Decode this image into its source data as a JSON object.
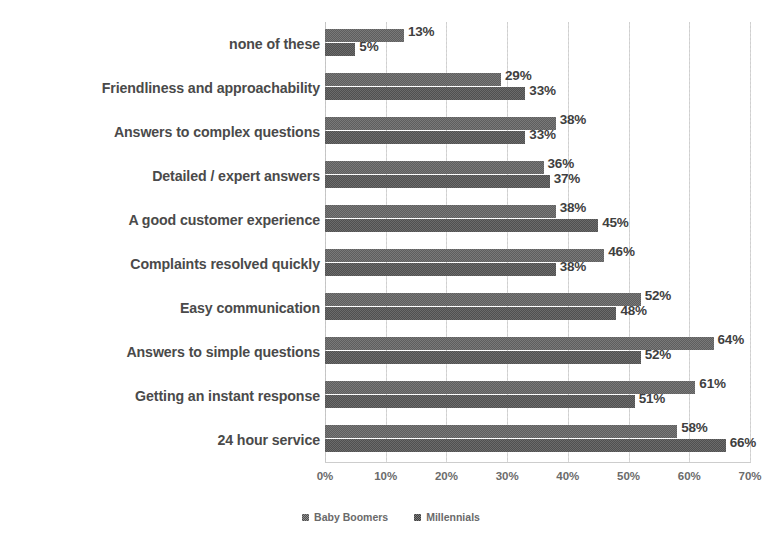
{
  "chart_data": {
    "type": "bar",
    "orientation": "horizontal",
    "title": "",
    "subtitle": "",
    "xlabel": "",
    "ylabel": "",
    "xlim": [
      0,
      70
    ],
    "xtick_labels": [
      "0%",
      "10%",
      "20%",
      "30%",
      "40%",
      "50%",
      "60%",
      "70%"
    ],
    "xtick_values": [
      0,
      10,
      20,
      30,
      40,
      50,
      60,
      70
    ],
    "grid": true,
    "grid_axis": "x",
    "legend_position": "bottom-center",
    "value_label_suffix": "%",
    "categories": [
      "none of these",
      "Friendliness and approachability",
      "Answers to complex questions",
      "Detailed / expert answers",
      "A good customer experience",
      "Complaints resolved quickly",
      "Easy communication",
      "Answers to simple questions",
      "Getting an instant response",
      "24 hour service"
    ],
    "series": [
      {
        "name": "Baby Boomers",
        "color": "#767676",
        "values": [
          13,
          29,
          38,
          36,
          38,
          46,
          52,
          64,
          61,
          58
        ],
        "labels": [
          "13%",
          "29%",
          "38%",
          "36%",
          "38%",
          "46%",
          "52%",
          "64%",
          "61%",
          "58%"
        ]
      },
      {
        "name": "Millennials",
        "color": "#5f5f5f",
        "values": [
          5,
          33,
          33,
          37,
          45,
          38,
          48,
          52,
          51,
          66
        ],
        "labels": [
          "5%",
          "33%",
          "33%",
          "37%",
          "45%",
          "38%",
          "48%",
          "52%",
          "51%",
          "66%"
        ]
      }
    ]
  },
  "legend": {
    "items": [
      {
        "label": "Baby Boomers",
        "swatch_class": "sw-boomers"
      },
      {
        "label": "Millennials",
        "swatch_class": "sw-millennials"
      }
    ]
  },
  "colors": {
    "background": "#ffffff",
    "gridline": "#d8d8d8",
    "category_label": "#4a4a4a",
    "value_label": "#3f3f3f",
    "tick_label": "#6b6b6b",
    "series_baby_boomers": "#767676",
    "series_millennials": "#5f5f5f"
  }
}
